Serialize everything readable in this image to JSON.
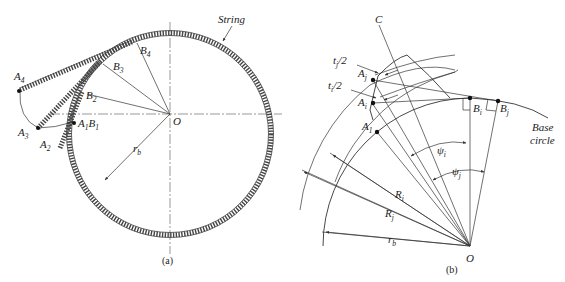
{
  "figure": {
    "panel_a": {
      "caption": "(a)",
      "labels": {
        "string": "String",
        "A4": "A",
        "A4_sub": "4",
        "A3": "A",
        "A3_sub": "3",
        "A2": "A",
        "A2_sub": "2",
        "A1B1": "A",
        "A1B1_sub1": "1",
        "A1B1_B": "B",
        "A1B1_sub2": "1",
        "B2": "B",
        "B2_sub": "2",
        "B3": "B",
        "B3_sub": "3",
        "B4": "B",
        "B4_sub": "4",
        "O": "O",
        "rb": "r",
        "rb_sub": "b"
      }
    },
    "panel_b": {
      "caption": "(b)",
      "labels": {
        "C": "C",
        "tj_half": "t",
        "tj_half_sub": "j",
        "tj_half_rest": "/2",
        "ti_half": "t",
        "ti_half_sub": "i",
        "ti_half_rest": "/2",
        "Aj": "A",
        "Aj_sub": "j",
        "Ai": "A",
        "Ai_sub": "i",
        "A1": "A",
        "A1_sub": "1",
        "Bi": "B",
        "Bi_sub": "i",
        "Bj": "B",
        "Bj_sub": "j",
        "base_circle_1": "Base",
        "base_circle_2": "circle",
        "psi_i": "ψ",
        "psi_i_sub": "i",
        "psi_j": "ψ",
        "psi_j_sub": "j",
        "Ri": "R",
        "Ri_sub": "i",
        "Rj": "R",
        "Rj_sub": "j",
        "rb": "r",
        "rb_sub": "b",
        "O": "O"
      }
    }
  }
}
